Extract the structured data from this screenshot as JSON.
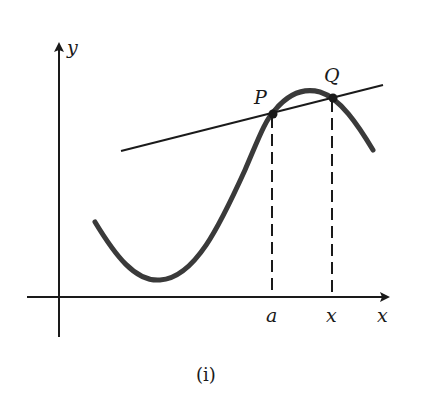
{
  "figure": {
    "caption": "(i)",
    "axes": {
      "x_label": "x",
      "y_label": "y"
    },
    "points": {
      "p_label": "P",
      "q_label": "Q"
    },
    "ticks": {
      "a_label": "a",
      "x_label": "x"
    },
    "elements": [
      "curve y=f(x)",
      "secant line through P and Q",
      "dashed vertical from P to a",
      "dashed vertical from Q to x"
    ],
    "colors": {
      "ink": "#1a1a1a",
      "curve": "#3a3a3a",
      "background": "#ffffff"
    }
  }
}
